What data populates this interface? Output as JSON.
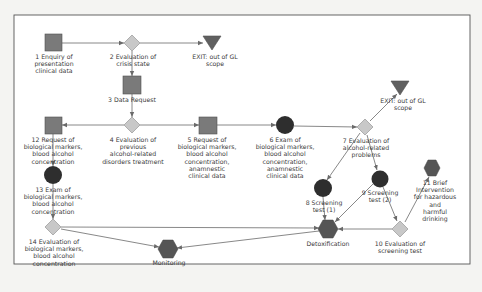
{
  "diagram": {
    "type": "flowchart",
    "colors": {
      "background": "#f4f4f2",
      "frame": "#555555",
      "edge": "#6a6a6a",
      "activity_square": "#7a7a7a",
      "decision_diamond": "#c8c8c8",
      "exam_circle": "#2e2e2e",
      "hexagon": "#555555",
      "exit_triangle": "#606060",
      "text": "#3a3a3a"
    },
    "nodes": [
      {
        "id": "n1",
        "shape": "square",
        "label": "1 Enquiry of\npresentation\nclinical data"
      },
      {
        "id": "n2",
        "shape": "diamond",
        "label": "2 Evaluation of\ncrisis state"
      },
      {
        "id": "exit1",
        "shape": "triangle",
        "label": "EXIT: out of GL\nscope"
      },
      {
        "id": "n3",
        "shape": "square",
        "label": "3 Data Request"
      },
      {
        "id": "n4",
        "shape": "diamond",
        "label": "4 Evaluation of\nprevious\nalcohol-related\ndisorders treatment"
      },
      {
        "id": "n12",
        "shape": "square",
        "label": "12 Request of\nbiological markers,\nblood alcohol\nconcentration"
      },
      {
        "id": "n5",
        "shape": "square",
        "label": "5 Request of\nbiological markers,\nblood alcohol\nconcentration,\nanamnestic\nclinical data"
      },
      {
        "id": "n6",
        "shape": "circle",
        "label": "6 Exam of\nbiological markers,\nblood alcohol\nconcentration,\nanamnestic\nclinical data"
      },
      {
        "id": "n7",
        "shape": "diamond",
        "label": "7 Evaluation of\nalcohol-related\nproblems"
      },
      {
        "id": "exit2",
        "shape": "triangle",
        "label": "EXIT: out of GL\nscope"
      },
      {
        "id": "n13",
        "shape": "circle",
        "label": "13 Exam of\nbiological markers,\nblood alcohol\nconcentration"
      },
      {
        "id": "n14",
        "shape": "diamond",
        "label": "14 Evaluation of\nbiological markers,\nblood alcohol\nconcentration"
      },
      {
        "id": "n8",
        "shape": "circle",
        "label": "8 Screening\ntest (1)"
      },
      {
        "id": "n9",
        "shape": "circle",
        "label": "9 Screening\ntest (2)"
      },
      {
        "id": "n11",
        "shape": "hexagon",
        "label": "11 Brief Intervention\nfor hazardous and\nharmful drinking"
      },
      {
        "id": "detox",
        "shape": "hexagon",
        "label": "Detoxification"
      },
      {
        "id": "n10",
        "shape": "diamond",
        "label": "10 Evaluation of\nscreening test"
      },
      {
        "id": "monitoring",
        "shape": "hexagon",
        "label": "Monitoring"
      }
    ],
    "edges": [
      {
        "from": "n1",
        "to": "n2"
      },
      {
        "from": "n2",
        "to": "exit1"
      },
      {
        "from": "n2",
        "to": "n3"
      },
      {
        "from": "n3",
        "to": "n4"
      },
      {
        "from": "n4",
        "to": "n12"
      },
      {
        "from": "n4",
        "to": "n5"
      },
      {
        "from": "n5",
        "to": "n6"
      },
      {
        "from": "n6",
        "to": "n7"
      },
      {
        "from": "n7",
        "to": "exit2"
      },
      {
        "from": "n7",
        "to": "n8"
      },
      {
        "from": "n7",
        "to": "n9"
      },
      {
        "from": "n12",
        "to": "n13"
      },
      {
        "from": "n13",
        "to": "n14"
      },
      {
        "from": "n14",
        "to": "detox"
      },
      {
        "from": "n14",
        "to": "monitoring"
      },
      {
        "from": "n8",
        "to": "detox"
      },
      {
        "from": "n9",
        "to": "detox"
      },
      {
        "from": "n9",
        "to": "n10"
      },
      {
        "from": "n10",
        "to": "detox"
      },
      {
        "from": "n10",
        "to": "n11"
      },
      {
        "from": "detox",
        "to": "monitoring"
      }
    ]
  }
}
